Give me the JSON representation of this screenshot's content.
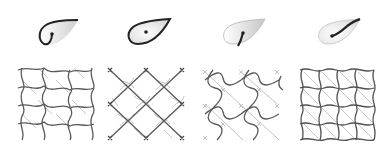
{
  "figure": {
    "colors": {
      "background": "#ffffff",
      "outline": "#222222",
      "primary_line": "#555555",
      "secondary_line": "#bdbdbd",
      "shade": "#d0d0d0"
    },
    "panels": [
      {
        "id": "a",
        "glyph": {
          "type": "teardrop-with-hook",
          "outline": "partial-bold"
        },
        "tile": {
          "type": "wavy-pinwheel-lattice",
          "secondary": "diagonal-light"
        },
        "left": 8
      },
      {
        "id": "b",
        "glyph": {
          "type": "teardrop-with-dot",
          "outline": "full-bold"
        },
        "tile": {
          "type": "diagonal-square-lattice",
          "secondary": "wavy-cross-light"
        },
        "left": 98
      },
      {
        "id": "c",
        "glyph": {
          "type": "teardrop-with-short-stroke",
          "outline": "faint"
        },
        "tile": {
          "type": "wavy-s-lattice",
          "secondary": "diagonal-light"
        },
        "left": 193
      },
      {
        "id": "d",
        "glyph": {
          "type": "teardrop-with-long-stroke",
          "outline": "faint"
        },
        "tile": {
          "type": "wavy-square-grid",
          "secondary": "diagonal-light"
        },
        "left": 288
      }
    ]
  }
}
